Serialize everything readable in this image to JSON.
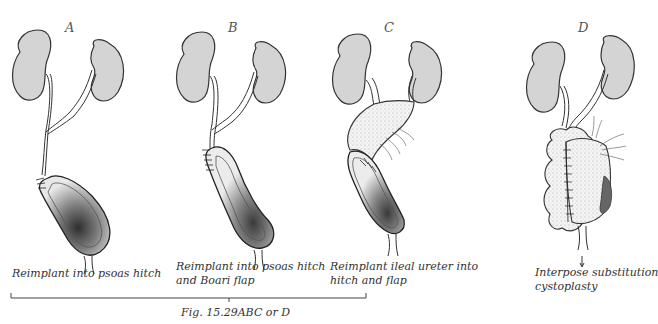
{
  "panels": [
    {
      "letter": "A",
      "caption_lines": [
        "Reimplant into psoas hitch"
      ]
    },
    {
      "letter": "B",
      "caption_lines": [
        "Reimplant into psoas hitch",
        "and Boari flap"
      ]
    },
    {
      "letter": "C",
      "caption_lines": [
        "Reimplant ileal ureter into",
        "hitch and flap"
      ]
    },
    {
      "letter": "D",
      "caption_lines": [
        "Interpose substitution",
        "cystoplasty"
      ]
    }
  ],
  "figure_label": "Fig. 15.29ABC or D",
  "colors": {
    "kidney_fill": "#d4d4d4",
    "outline": "#333333",
    "bladder_dark": "#3a3a3a",
    "background": "#ffffff"
  }
}
